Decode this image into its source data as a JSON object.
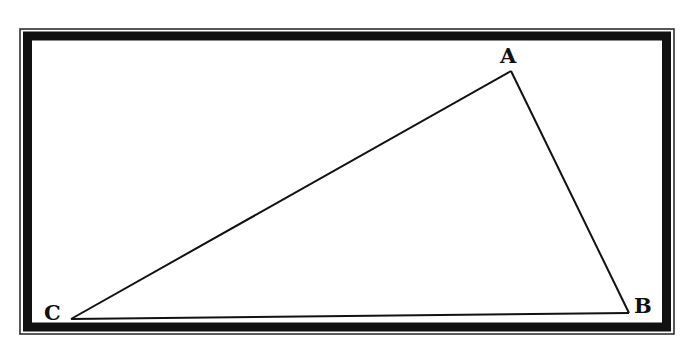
{
  "diagram": {
    "type": "triangle",
    "vertices": [
      {
        "label": "A",
        "x": 511,
        "y": 71
      },
      {
        "label": "B",
        "x": 629,
        "y": 313
      },
      {
        "label": "C",
        "x": 71,
        "y": 319
      }
    ],
    "edges": [
      [
        "A",
        "B"
      ],
      [
        "B",
        "C"
      ],
      [
        "C",
        "A"
      ]
    ],
    "frame": {
      "style": "double-border",
      "color": "#111111"
    }
  }
}
